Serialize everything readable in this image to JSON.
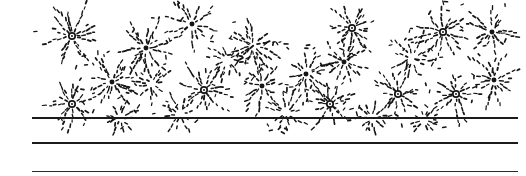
{
  "figure": {
    "width": 526,
    "height": 176,
    "background_color": "#ffffff",
    "ink_color": "#1b1b1b"
  },
  "rules": [
    {
      "name": "upper-rule",
      "x": 32,
      "y": 117,
      "width": 486,
      "height": 2,
      "color": "#1b1b1b"
    },
    {
      "name": "middle-rule",
      "x": 32,
      "y": 142,
      "width": 486,
      "height": 2,
      "color": "#1b1b1b"
    },
    {
      "name": "lower-rule",
      "x": 32,
      "y": 171,
      "width": 486,
      "height": 1,
      "color": "#2a2a2a"
    }
  ],
  "burst_field": {
    "name": "starburst-field",
    "region": {
      "x": 38,
      "y": 4,
      "width": 478,
      "height": 124
    },
    "mark_color": "#151515",
    "dash_length": 2.6,
    "dash_gap": 2.2,
    "dash_width": 1.4,
    "hub_outer_radius": 3.2,
    "hub_inner_radius": 1.3,
    "ray_count_range": [
      9,
      15
    ],
    "ray_length_range": [
      16,
      34
    ],
    "ray_curvature": 0.28,
    "bursts": [
      {
        "cx": 72,
        "cy": 36,
        "r": 30,
        "rays": 13,
        "hub": "ring",
        "seed": 11
      },
      {
        "cx": 146,
        "cy": 48,
        "r": 27,
        "rays": 12,
        "hub": "dot",
        "seed": 23
      },
      {
        "cx": 192,
        "cy": 24,
        "r": 24,
        "rays": 11,
        "hub": "dot",
        "seed": 37
      },
      {
        "cx": 112,
        "cy": 82,
        "r": 29,
        "rays": 13,
        "hub": "dot",
        "seed": 41
      },
      {
        "cx": 72,
        "cy": 104,
        "r": 25,
        "rays": 12,
        "hub": "ring",
        "seed": 53
      },
      {
        "cx": 152,
        "cy": 84,
        "r": 24,
        "rays": 11,
        "hub": "plain",
        "seed": 67
      },
      {
        "cx": 204,
        "cy": 90,
        "r": 27,
        "rays": 12,
        "hub": "ring",
        "seed": 71
      },
      {
        "cx": 253,
        "cy": 46,
        "r": 28,
        "rays": 13,
        "hub": "plain",
        "seed": 83
      },
      {
        "cx": 262,
        "cy": 86,
        "r": 24,
        "rays": 11,
        "hub": "dot",
        "seed": 97
      },
      {
        "cx": 306,
        "cy": 74,
        "r": 27,
        "rays": 12,
        "hub": "dot",
        "seed": 101
      },
      {
        "cx": 330,
        "cy": 104,
        "r": 25,
        "rays": 12,
        "hub": "ring",
        "seed": 103
      },
      {
        "cx": 352,
        "cy": 28,
        "r": 28,
        "rays": 13,
        "hub": "ring",
        "seed": 107
      },
      {
        "cx": 344,
        "cy": 62,
        "r": 23,
        "rays": 11,
        "hub": "dot",
        "seed": 109
      },
      {
        "cx": 398,
        "cy": 94,
        "r": 26,
        "rays": 12,
        "hub": "ring",
        "seed": 113
      },
      {
        "cx": 412,
        "cy": 58,
        "r": 24,
        "rays": 11,
        "hub": "plain",
        "seed": 127
      },
      {
        "cx": 443,
        "cy": 32,
        "r": 29,
        "rays": 13,
        "hub": "ring",
        "seed": 131
      },
      {
        "cx": 456,
        "cy": 94,
        "r": 26,
        "rays": 12,
        "hub": "ring",
        "seed": 137
      },
      {
        "cx": 492,
        "cy": 32,
        "r": 25,
        "rays": 12,
        "hub": "dot",
        "seed": 139
      },
      {
        "cx": 494,
        "cy": 80,
        "r": 27,
        "rays": 12,
        "hub": "dot",
        "seed": 149
      },
      {
        "cx": 228,
        "cy": 60,
        "r": 22,
        "rays": 10,
        "hub": "plain",
        "seed": 151
      },
      {
        "cx": 286,
        "cy": 112,
        "r": 20,
        "rays": 10,
        "hub": "plain",
        "seed": 157
      },
      {
        "cx": 180,
        "cy": 114,
        "r": 19,
        "rays": 10,
        "hub": "plain",
        "seed": 163
      },
      {
        "cx": 372,
        "cy": 118,
        "r": 20,
        "rays": 10,
        "hub": "plain",
        "seed": 167
      },
      {
        "cx": 120,
        "cy": 118,
        "r": 18,
        "rays": 9,
        "hub": "plain",
        "seed": 173
      },
      {
        "cx": 424,
        "cy": 120,
        "r": 18,
        "rays": 9,
        "hub": "plain",
        "seed": 179
      }
    ]
  }
}
